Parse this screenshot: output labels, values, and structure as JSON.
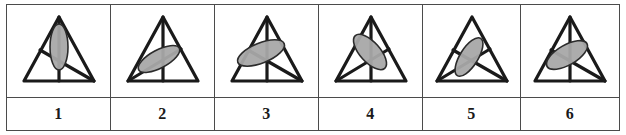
{
  "figure": {
    "type": "visual-analogy-puzzle-answer-options",
    "option_count": 6,
    "grid": {
      "rows": 2,
      "columns": 6,
      "label_row_position": "bottom"
    },
    "style": {
      "background_color": "#ffffff",
      "border_color": "#4b4b4b",
      "stroke_color": "#1a1a1a",
      "ellipse_fill_color": "#a8a8a8",
      "ellipse_stroke_color": "#2b2b2b",
      "label_text_color": "#1a1a1a"
    },
    "shared_shape": {
      "name": "triangle",
      "description": "upward-pointing isoceles triangle outline"
    },
    "options": [
      {
        "label": "1",
        "name": "option-1",
        "elements": [
          "triangle",
          "vertical-median-line",
          "line-left-edge-to-bottom-right-corner",
          "ellipse"
        ],
        "has_median": true,
        "has_left_to_bottom_right_line": true,
        "has_bottom_left_to_right_line": false,
        "ellipse": {
          "orientation": "vertical",
          "rotation_deg": 0,
          "rx": 9,
          "ry": 23,
          "cx": 0,
          "cy": -4,
          "shape": "narrow-tall"
        }
      },
      {
        "label": "2",
        "name": "option-2",
        "elements": [
          "triangle",
          "vertical-median-line",
          "line-bottom-left-corner-to-right-edge",
          "ellipse"
        ],
        "has_median": true,
        "has_left_to_bottom_right_line": false,
        "has_bottom_left_to_right_line": true,
        "ellipse": {
          "orientation": "tilted-up-right",
          "rotation_deg": -28,
          "rx": 23,
          "ry": 9,
          "cx": -4,
          "cy": 8,
          "shape": "elongated"
        }
      },
      {
        "label": "3",
        "name": "option-3",
        "elements": [
          "triangle",
          "vertical-median-line",
          "line-left-edge-to-bottom-right-corner",
          "ellipse"
        ],
        "has_median": true,
        "has_left_to_bottom_right_line": true,
        "has_bottom_left_to_right_line": false,
        "ellipse": {
          "orientation": "tilted-up-right-flat",
          "rotation_deg": -22,
          "rx": 25,
          "ry": 10,
          "cx": -6,
          "cy": 2,
          "shape": "wide-flat"
        }
      },
      {
        "label": "4",
        "name": "option-4",
        "elements": [
          "triangle",
          "vertical-median-line",
          "line-bottom-left-corner-to-right-edge",
          "ellipse"
        ],
        "has_median": true,
        "has_left_to_bottom_right_line": false,
        "has_bottom_left_to_right_line": true,
        "ellipse": {
          "orientation": "tilted-down-right",
          "rotation_deg": 48,
          "rx": 22,
          "ry": 10,
          "cx": -1,
          "cy": 1,
          "shape": "elongated"
        }
      },
      {
        "label": "5",
        "name": "option-5",
        "elements": [
          "triangle",
          "line-left-edge-to-bottom-right-corner",
          "line-bottom-left-corner-to-right-edge",
          "ellipse"
        ],
        "has_median": false,
        "has_left_to_bottom_right_line": true,
        "has_bottom_left_to_right_line": true,
        "ellipse": {
          "orientation": "tilted-steep-up-right",
          "rotation_deg": -58,
          "rx": 22,
          "ry": 9,
          "cx": -3,
          "cy": 6,
          "shape": "narrow-steep"
        }
      },
      {
        "label": "6",
        "name": "option-6",
        "elements": [
          "triangle",
          "vertical-median-line",
          "line-left-edge-to-bottom-right-corner",
          "ellipse"
        ],
        "has_median": true,
        "has_left_to_bottom_right_line": true,
        "has_bottom_left_to_right_line": false,
        "ellipse": {
          "orientation": "tilted-up-right",
          "rotation_deg": -30,
          "rx": 23,
          "ry": 10,
          "cx": -3,
          "cy": 4,
          "shape": "elongated"
        }
      }
    ]
  }
}
